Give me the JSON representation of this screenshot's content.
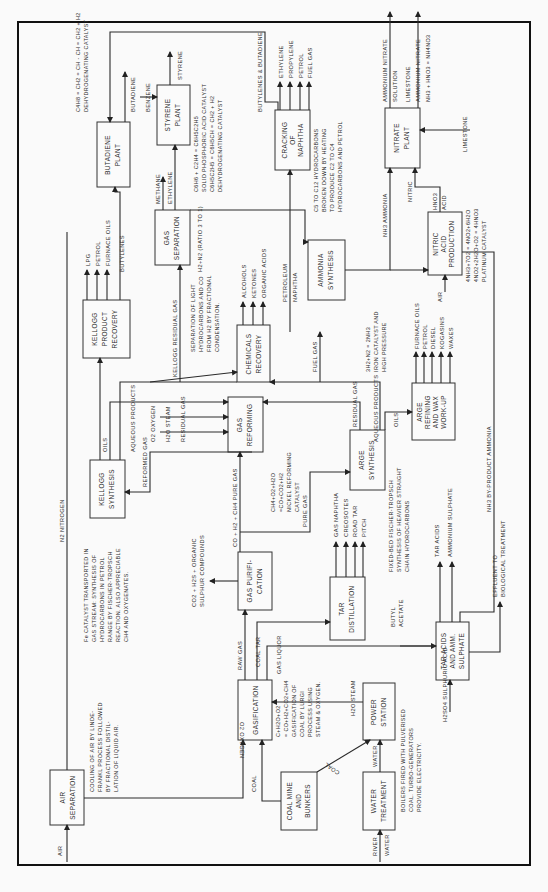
{
  "orientation": "rotated 90 degrees counter-clockwise",
  "units": {
    "air_separation": {
      "label": [
        "AIR",
        "SEPARATION"
      ]
    },
    "coal_mine": {
      "label": [
        "COAL MINE",
        "AND",
        "BUNKERS"
      ]
    },
    "water_treatment": {
      "label": [
        "WATER",
        "TREATMENT"
      ]
    },
    "power_station": {
      "label": [
        "POWER",
        "STATION"
      ]
    },
    "gasification": {
      "label": [
        "GASIFICATION"
      ]
    },
    "gas_purification": {
      "label": [
        "GAS PURIFI-",
        "CATION"
      ]
    },
    "tar_distillation": {
      "label": [
        "TAR",
        "DISTILLATION"
      ]
    },
    "tar_acids": {
      "label": [
        "TAR ACIDS",
        "AND AMM.",
        "SULPHATE"
      ]
    },
    "kellogg_synthesis": {
      "label": [
        "KELLOGG",
        "SYNTHESIS"
      ]
    },
    "gas_reforming": {
      "label": [
        "GAS",
        "REFORMING"
      ]
    },
    "arge_synthesis": {
      "label": [
        "ARGE",
        "SYNTHESIS"
      ]
    },
    "arge_refining": {
      "label": [
        "ARGE",
        "REFINING",
        "AND WAX",
        "WORK-UP"
      ]
    },
    "kellogg_recovery": {
      "label": [
        "KELLOGG",
        "PRODUCT",
        "RECOVERY"
      ]
    },
    "chemicals_recovery": {
      "label": [
        "CHEMICALS",
        "RECOVERY"
      ]
    },
    "gas_separation": {
      "label": [
        "GAS",
        "SEPARATION"
      ]
    },
    "ammonia_synthesis": {
      "label": [
        "AMMONIA",
        "SYNTHESIS"
      ]
    },
    "nitric_acid": {
      "label": [
        "NITRIC",
        "ACID",
        "PRODUCTION"
      ]
    },
    "butadiene_plant": {
      "label": [
        "BUTADIENE",
        "PLANT"
      ]
    },
    "styrene_plant": {
      "label": [
        "STYRENE",
        "PLANT"
      ]
    },
    "cracking": {
      "label": [
        "CRACKING",
        "OF",
        "NAPHTHA"
      ]
    },
    "nitrate_plant": {
      "label": [
        "NITRATE",
        "PLANT"
      ]
    }
  },
  "streams": {
    "air": "AIR",
    "n2_nitrogen": "N2 NITROGEN",
    "o2_oxygen": "O2 OXYGEN",
    "coal": "COAL",
    "coal_to_power": "COAL",
    "h2o_steam": "H2O STEAM",
    "river_water": [
      "RIVER",
      "WATER"
    ],
    "water": "WATER",
    "raw_gas": "RAW GAS",
    "coal_tar": "COAL TAR",
    "gas_liquor": "GAS LIQUOR",
    "butyl_acetate": [
      "BUTYL",
      "ACETATE"
    ],
    "h2so4": "H2SO4 SULPHURIC ACID",
    "effluent": [
      "EFFLUENT TO",
      "BIOLOGICAL TREATMENT"
    ],
    "tar_products": [
      "GAS NAPHTHA",
      "CREOSOTES",
      "ROAD TAR",
      "PITCH"
    ],
    "tar_acid_products": [
      "TAR ACIDS",
      "AMMONIUM SULPHATE"
    ],
    "purification_byproduct": [
      "CO2 + H2S + ORGANIC",
      "SULPHUR COMPOUNDS"
    ],
    "pure_gas_main": "CO + H2 + CH4 PURE GAS",
    "pure_gas": "PURE GAS",
    "reformed_gas": "REFORMED GAS",
    "residual_gas_left": "RESIDUAL GAS",
    "residual_gas_right": "RESIDUAL GAS",
    "h2o_steam_reforming": "H2O STEAM",
    "o2_oxygen_reforming": "O2 OXYGEN",
    "oils_kellogg": "OILS",
    "oils_arge": "OILS",
    "aqueous_products_left": "AQUEOUS PRODUCTS",
    "aqueous_products_right": "AQUEOUS PRODUCTS",
    "kellogg_residual_gas": "KELLOGG RESIDUAL GAS",
    "fuel_gas": "FUEL GAS",
    "kellogg_products": [
      "LPG",
      "PETROL",
      "FURNACE OILS",
      "BUTYLENES"
    ],
    "chemicals": [
      "ALCOHOLS",
      "KETONES",
      "ORGANIC ACIDS"
    ],
    "arge_products": [
      "FURNACE OILS",
      "PETROL",
      "DIESEL",
      "KOGASINS",
      "WAXES"
    ],
    "nh3_byproduct": "NH3 BY-PRODUCT AMMONIA",
    "petroleum_naphtha": [
      "PETROLEUM",
      "NAPHTHA"
    ],
    "h2_n2": "H2+N2 (RATIO 3 TO 1)",
    "methane": "METHANE",
    "ethylene": "ETHYLENE",
    "nh3_ammonia": "NH3 AMMONIA",
    "air_nitric": "AIR",
    "hno3": [
      "HNO3",
      "ACID"
    ],
    "nitric": "NITRIC",
    "limestone_in": "LIMESTONE",
    "nitrate_products": [
      "AMMONIUM NITRATE",
      "SOLUTION",
      "LIMESTONE",
      "AMMONIUM NITRATE"
    ],
    "cracking_products": [
      "ETHYLENE",
      "PROPYLENE",
      "PETROL",
      "FUEL GAS"
    ],
    "butylenes_butadiene": "BUTYLENES & BUTADIENE",
    "butadiene": "BUTADIENE",
    "benzene": "BENZENE",
    "styrene": "STYRENE"
  },
  "notes": {
    "air_separation": [
      "COOLING OF AIR BY LINDE-",
      "FRANKL PROCESS FOLLOWED",
      "BY FRACTIONAL DISTIL-",
      "LATION OF LIQUID AIR."
    ],
    "power": [
      "BOILERS FIRED WITH PULVERISED",
      "COAL. TURBO-GENERATORS",
      "PROVIDE ELECTRICITY."
    ],
    "gasification": [
      "C+H2O+O2",
      "= CO+H2+CO2+CH4",
      "GASIFICATION OF",
      "COAL BY LURGI",
      "PROCESS USING",
      "STEAM & OXYGEN."
    ],
    "kellogg": [
      "Fe CATALYST TRANSPORTED IN",
      "GAS STREAM: SYNTHESIS OF",
      "HYDROCARBONS IN PETROL",
      "RANGE BY FISCHER-TROPSCH",
      "REACTION. ALSO APPRECIABLE",
      "CH4 AND OXYGENATES."
    ],
    "reforming": [
      "CH4+O2+H2O",
      "=CO+CO2+H2",
      "NICKEL REFORMING",
      "CATALYST"
    ],
    "arge": [
      "FIXED-BED FISCHER-TROPSCH",
      "SYNTHESIS OF HEAVIER STRAIGHT",
      "CHAIN HYDROCARBONS"
    ],
    "gas_separation": [
      "SEPARATION OF LIGHT",
      "HYDROCARBONS AND CO",
      "FROM H2 BY FRACTIONAL",
      "CONDENSATION."
    ],
    "ammonia": [
      "3H2+N2 = 2NH3",
      "IRON CATALYST AND",
      "HIGH PRESSURE"
    ],
    "nitric": [
      "4NH3+7O2 = 4NO2+6H2O",
      "4NO2+2H2O+O2 = 4HNO3",
      "PLATINUM CATALYST"
    ],
    "cracking": [
      "C5 TO C12 HYDROCARBONS",
      "BROKEN DOWN BY HEATING",
      "TO PRODUCE C2 TO C4",
      "HYDROCARBONS AND PETROL"
    ],
    "styrene": [
      "C6H6 + C2H4 = C6H5C2H5",
      "SOLID PHOSPHORIC ACID CATALYST",
      "C6H5C2H5 = C6H5CH = CH2 + H2",
      "DEHYDROGENATING CATALYST"
    ],
    "butadiene": [
      "C4H8 = CH2 = CH - CH = CH2 + H2",
      "DEHYDROGENATING CATALYST"
    ],
    "nitrate": [
      "NH3 + HNO3 = NH4NO3"
    ]
  }
}
